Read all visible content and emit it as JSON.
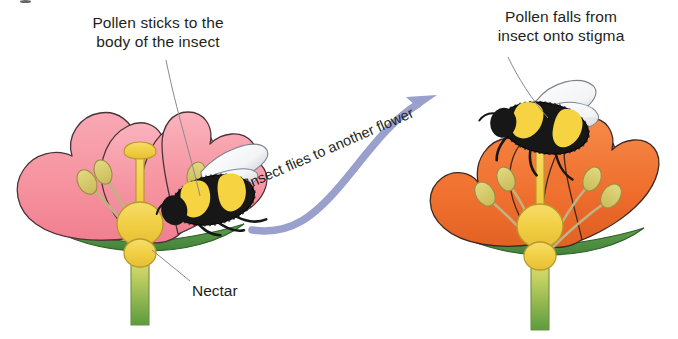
{
  "diagram": {
    "captions": {
      "left": "Pollen sticks to the\nbody of the insect",
      "right": "Pollen falls from\ninsect onto stigma"
    },
    "labels": {
      "nectar": "Nectar",
      "arrow": "Insect flies to another flower"
    },
    "colors": {
      "petal_left": "#F69AA7",
      "petal_left_shade": "#EE7F90",
      "petal_right": "#F0702F",
      "petal_right_shade": "#DF5F22",
      "pistil": "#F2D24B",
      "pistil_shade": "#E3BE35",
      "anther": "#D9CE6B",
      "filament": "#CFC58F",
      "sepal": "#4E8C3F",
      "stem_top": "#E8DE7C",
      "stem_bottom": "#5B9B3E",
      "bee_body": "#1A1A1A",
      "bee_band": "#F6D340",
      "wing": "#FAFAFA",
      "wing_shade": "#B9BFC9",
      "arrow": "#9AA0CC",
      "text": "#231F20",
      "leader": "#8A8A8A"
    },
    "elements": {
      "left_flower": "pink flower with bumblebee on petal",
      "right_flower": "orange flower with bumblebee on stigma",
      "arrow": "curved arrow from left flower to right flower"
    }
  }
}
